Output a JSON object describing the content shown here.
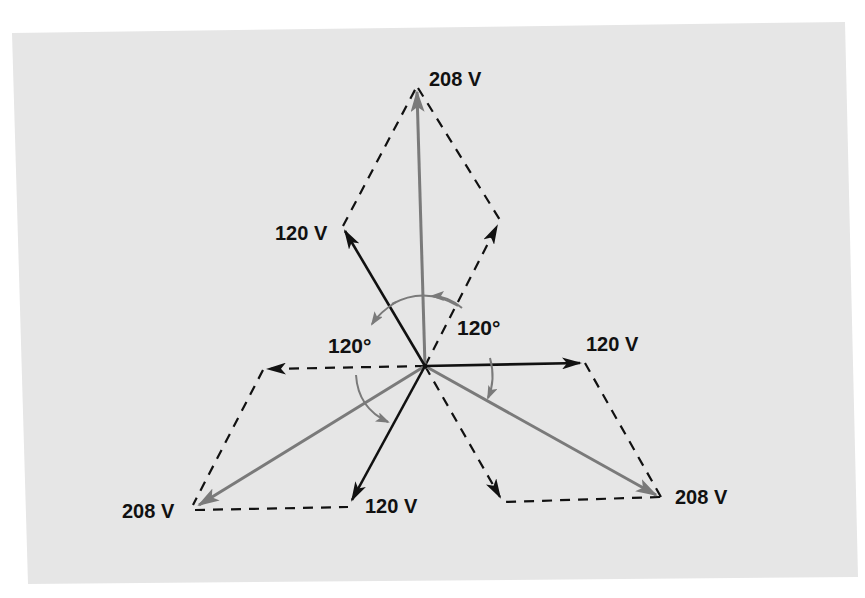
{
  "diagram": {
    "title": "",
    "colors": {
      "background": "#ffffff",
      "panel": "#e6e6e6",
      "phase_vector": "#111111",
      "resultant_vector": "#7a7a7a",
      "angle_arc": "#7a7a7a",
      "dashed": "#111111"
    },
    "labels": {
      "top_resultant": "208 V",
      "upper_left_phase": "120 V",
      "right_phase": "120 V",
      "lower_left_resultant": "208 V",
      "bottom_phase": "120 V",
      "lower_right_resultant": "208 V",
      "angle_left": "120°",
      "angle_right": "120°"
    },
    "phase_voltage": "120 V",
    "line_voltage": "208 V",
    "phase_angle": "120°"
  }
}
